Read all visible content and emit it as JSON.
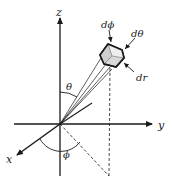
{
  "diagram": {
    "axes": {
      "z_label": "z",
      "y_label": "y",
      "x_label": "x"
    },
    "angles": {
      "polar_label": "θ",
      "azimuth_label": "ϕ"
    },
    "element_labels": {
      "d_phi": "dϕ",
      "d_theta": "dθ",
      "d_r": "dr"
    },
    "colors": {
      "ink": "#1a1a1a",
      "box_face_light": "#e6e6e6",
      "box_face_mid": "#cfcfcf",
      "background": "#ffffff"
    }
  }
}
